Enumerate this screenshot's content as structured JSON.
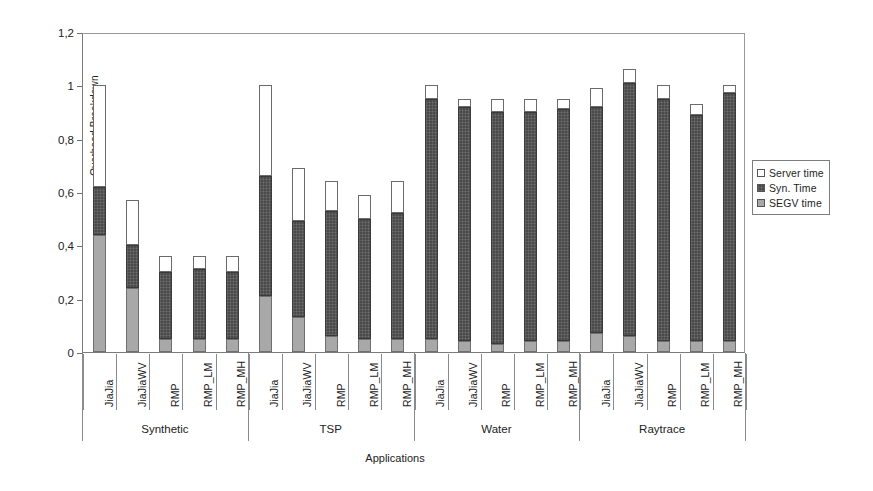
{
  "chart_data": {
    "type": "bar",
    "stacked": true,
    "title": "",
    "xlabel": "Applications",
    "ylabel": "Overhead Breakdown",
    "ylim": [
      0,
      1.2
    ],
    "yticks": [
      "0",
      "0,2",
      "0,4",
      "0,6",
      "0,8",
      "1",
      "1,2"
    ],
    "ytick_values": [
      0,
      0.2,
      0.4,
      0.6,
      0.8,
      1.0,
      1.2
    ],
    "grid": false,
    "legend_position": "right",
    "categories": [
      "JiaJia",
      "JiaJiaWV",
      "RMP",
      "RMP_LM",
      "RMP_MH",
      "JiaJia",
      "JiaJiaWV",
      "RMP",
      "RMP_LM",
      "RMP_MH",
      "JiaJia",
      "JiaJiaWV",
      "RMP",
      "RMP_LM",
      "RMP_MH",
      "JiaJia",
      "JiaJiaWV",
      "RMP",
      "RMP_LM",
      "RMP_MH"
    ],
    "groups": [
      {
        "label": "Synthetic",
        "start": 0,
        "count": 5
      },
      {
        "label": "TSP",
        "start": 5,
        "count": 5
      },
      {
        "label": "Water",
        "start": 10,
        "count": 5
      },
      {
        "label": "Raytrace",
        "start": 15,
        "count": 5
      }
    ],
    "series": [
      {
        "name": "SEGV time",
        "color": "#a8a8a8",
        "values": [
          0.44,
          0.24,
          0.05,
          0.05,
          0.05,
          0.21,
          0.13,
          0.06,
          0.05,
          0.05,
          0.05,
          0.04,
          0.03,
          0.04,
          0.04,
          0.07,
          0.06,
          0.04,
          0.04,
          0.04
        ]
      },
      {
        "name": "Syn. Time",
        "color": "#4a4a4a",
        "values": [
          0.18,
          0.16,
          0.25,
          0.26,
          0.25,
          0.45,
          0.36,
          0.47,
          0.45,
          0.47,
          0.9,
          0.88,
          0.87,
          0.86,
          0.87,
          0.85,
          0.95,
          0.91,
          0.85,
          0.93
        ]
      },
      {
        "name": "Server time",
        "color": "#ffffff",
        "values": [
          0.38,
          0.17,
          0.06,
          0.05,
          0.06,
          0.34,
          0.2,
          0.11,
          0.09,
          0.12,
          0.05,
          0.03,
          0.05,
          0.05,
          0.04,
          0.07,
          0.05,
          0.05,
          0.04,
          0.03
        ]
      }
    ],
    "totals": [
      1.0,
      0.57,
      0.36,
      0.36,
      0.36,
      1.0,
      0.69,
      0.64,
      0.59,
      0.64,
      1.0,
      0.95,
      0.95,
      0.95,
      0.95,
      0.99,
      1.06,
      1.0,
      0.93,
      1.0
    ]
  },
  "legend": {
    "items": [
      {
        "label": "Server time",
        "swatch": "sw-server"
      },
      {
        "label": "Syn. Time",
        "swatch": "sw-syn"
      },
      {
        "label": "SEGV time",
        "swatch": "sw-segv"
      }
    ]
  }
}
